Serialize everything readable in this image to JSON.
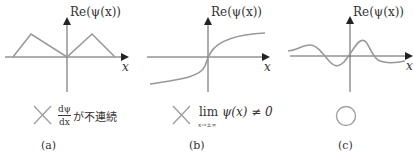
{
  "figure": {
    "panels": [
      {
        "id": "a",
        "y_axis_label": "Re(ψ(x))",
        "x_axis_label": "x",
        "curve": "two triangular bumps meeting at origin with a kink",
        "verdict_icon": "cross-mark",
        "verdict_fraction_numerator": "dψ",
        "verdict_fraction_denominator": "dx",
        "verdict_text": "が不連続",
        "caption": "(a)"
      },
      {
        "id": "b",
        "y_axis_label": "Re(ψ(x))",
        "x_axis_label": "x",
        "curve": "monotonic S-shaped curve approaching nonzero limits",
        "verdict_icon": "cross-mark",
        "verdict_lim": "lim",
        "verdict_lim_sub": "x→±∞",
        "verdict_text": "ψ(x) ≠ 0",
        "caption": "(b)"
      },
      {
        "id": "c",
        "y_axis_label": "Re(ψ(x))",
        "x_axis_label": "x",
        "curve": "smooth oscillating curve decaying to zero",
        "verdict_icon": "circle-mark",
        "caption": "(c)"
      }
    ],
    "colors": {
      "axis": "#333333",
      "curve": "#999999",
      "mark": "#a0a0a0",
      "text": "#333333"
    }
  }
}
